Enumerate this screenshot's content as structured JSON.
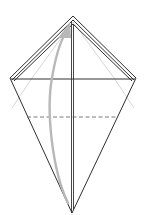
{
  "diagram": {
    "type": "origami-fold-step",
    "caption_clipped": "",
    "colors": {
      "outline": "#333333",
      "crease": "#bdbdbd",
      "arrow": "#b5b5b5",
      "background": "#ffffff"
    },
    "shape": {
      "top": [
        73,
        16
      ],
      "left": [
        10,
        78
      ],
      "right": [
        136,
        78
      ],
      "bottom": [
        72,
        213
      ]
    },
    "lines": {
      "horizontal_fold_y": 78,
      "dashed_valley_y": 117,
      "center_x": 72
    },
    "arrow": {
      "description": "fold bottom point up to top",
      "from": [
        68,
        205
      ],
      "to": [
        70,
        26
      ]
    }
  }
}
